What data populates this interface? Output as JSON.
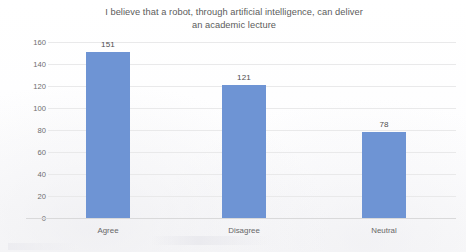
{
  "chart_data": {
    "type": "bar",
    "title": "I believe that a robot, through artificial intelligence, can deliver an academic lecture",
    "title_line1": "I believe that a robot, through artificial intelligence, can deliver",
    "title_line2": "an academic lecture",
    "categories": [
      "Agree",
      "Disagree",
      "Neutral"
    ],
    "values": [
      151,
      121,
      78
    ],
    "data_labels": [
      "151",
      "121",
      "78"
    ],
    "xlabel": "",
    "ylabel": "",
    "ylim": [
      0,
      160
    ],
    "ytick_step": 20,
    "yticks": [
      "160",
      "140",
      "120",
      "100",
      "80",
      "60",
      "40",
      "20",
      "0"
    ],
    "grid": "horizontal",
    "legend": "none",
    "series": [
      {
        "name": "Responses",
        "values": [
          151,
          121,
          78
        ],
        "color": "#6e94d4"
      }
    ],
    "colors": {
      "bar": "#6e94d4",
      "gridline": "#e9e9ea",
      "axis_line": "#d9d9da",
      "title_text": "#5c5c5c",
      "tick_text": "#6e6e6e",
      "label_text": "#4f4f4f",
      "background": "#fdfdfd"
    }
  }
}
